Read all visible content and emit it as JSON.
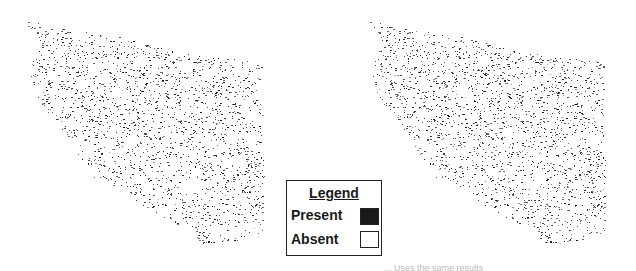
{
  "legend": {
    "title": "Legend",
    "items": [
      {
        "label": "Present",
        "color": "#1a1a1a"
      },
      {
        "label": "Absent",
        "color": "#ffffff"
      }
    ]
  },
  "maps": [
    {
      "id": "left",
      "offset_x": 0
    },
    {
      "id": "right",
      "offset_x": 342
    }
  ],
  "caption": "... Uses the same results"
}
